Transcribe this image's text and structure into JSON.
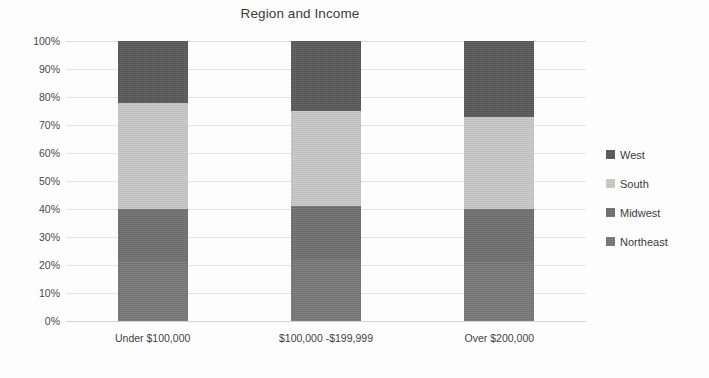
{
  "chart_data": {
    "type": "bar",
    "variant": "stacked-100-percent",
    "title": "Region and Income",
    "xlabel": "",
    "ylabel": "",
    "ylim": [
      0,
      100
    ],
    "grid": true,
    "legend_position": "right",
    "categories": [
      "Under $100,000",
      "$100,000 -$199,999",
      "Over $200,000"
    ],
    "y_ticks": [
      "0%",
      "10%",
      "20%",
      "30%",
      "40%",
      "50%",
      "60%",
      "70%",
      "80%",
      "90%",
      "100%"
    ],
    "y_tick_values": [
      0,
      10,
      20,
      30,
      40,
      50,
      60,
      70,
      80,
      90,
      100
    ],
    "series": [
      {
        "name": "Northeast",
        "color": "#767676",
        "values": [
          21,
          22,
          21
        ]
      },
      {
        "name": "Midwest",
        "color": "#6e6e6e",
        "values": [
          19,
          19,
          19
        ]
      },
      {
        "name": "South",
        "color": "#c8c8c8",
        "values": [
          38,
          34,
          33
        ]
      },
      {
        "name": "West",
        "color": "#575757",
        "values": [
          22,
          25,
          27
        ]
      }
    ],
    "legend_order_top_to_bottom": [
      "West",
      "South",
      "Midwest",
      "Northeast"
    ]
  },
  "colors": {
    "background": "#fdfdfd",
    "gridline": "#e3e3e0",
    "text": "#3b3b3b",
    "west": "#575757",
    "south": "#c8c8c8",
    "midwest": "#6e6e6e",
    "northeast": "#767676"
  }
}
